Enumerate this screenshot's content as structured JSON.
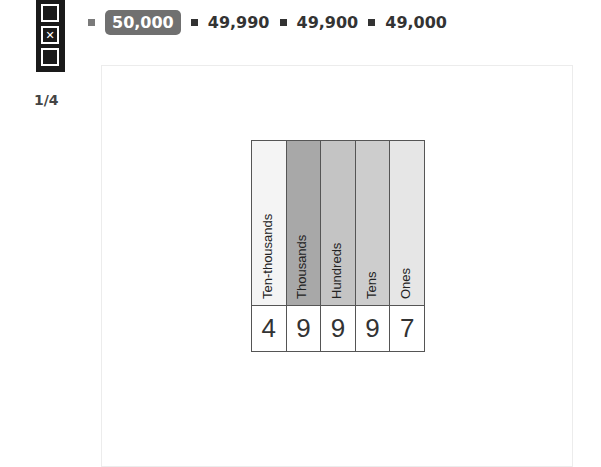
{
  "toolbar": {
    "tools": [
      {
        "name": "empty-box-icon",
        "glyph": ""
      },
      {
        "name": "close-box-icon",
        "glyph": "✕"
      },
      {
        "name": "empty-box-icon",
        "glyph": ""
      }
    ]
  },
  "pager": {
    "label": "1/4"
  },
  "options": [
    {
      "label": "50,000",
      "selected": true,
      "bullet_color": "#7a7a7a"
    },
    {
      "label": "49,990",
      "selected": false,
      "bullet_color": "#333333"
    },
    {
      "label": "49,900",
      "selected": false,
      "bullet_color": "#333333"
    },
    {
      "label": "49,000",
      "selected": false,
      "bullet_color": "#333333"
    }
  ],
  "place_value_chart": {
    "columns": [
      {
        "label": "Ten-thousands",
        "digit": "4",
        "color": "#f4f4f4"
      },
      {
        "label": "Thousands",
        "digit": "9",
        "color": "#a8a8a8"
      },
      {
        "label": "Hundreds",
        "digit": "9",
        "color": "#c4c4c4"
      },
      {
        "label": "Tens",
        "digit": "9",
        "color": "#cdcdcd"
      },
      {
        "label": "Ones",
        "digit": "7",
        "color": "#e6e6e6"
      }
    ]
  }
}
